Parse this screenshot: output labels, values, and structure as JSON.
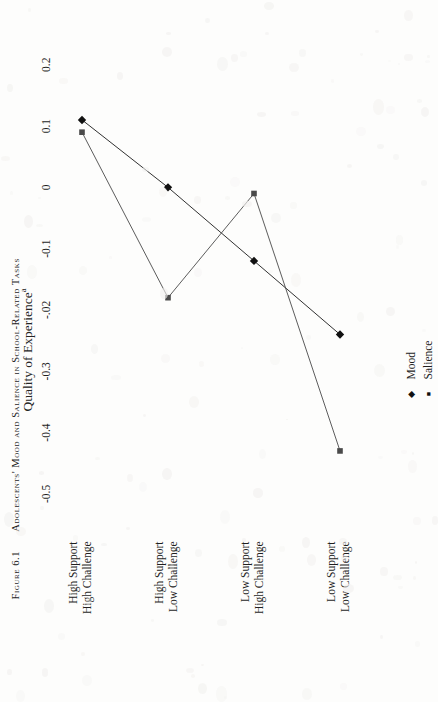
{
  "caption": {
    "figure_number": "Figure 6.1",
    "title": "Adolescents' Mood and Salience in School-Related Tasks"
  },
  "chart_data": {
    "type": "line",
    "title": "Adolescents' Mood and Salience in School-Related Tasks",
    "orientation": "rotated-90-ccw",
    "xlabel": "",
    "ylabel": "Quality of Experience",
    "ylabel_superscript": "a",
    "categories": [
      "High Support\nHigh Challenge",
      "High Support\nLow Challenge",
      "Low Support\nHigh Challenge",
      "Low Support\nLow Challenge"
    ],
    "category_lines": [
      [
        "High Support",
        "High Challenge"
      ],
      [
        "High Support",
        "Low Challenge"
      ],
      [
        "Low Support",
        "High Challenge"
      ],
      [
        "Low Support",
        "Low Challenge"
      ]
    ],
    "tick_labels": [
      "-0.5",
      "-0.4",
      "-0.3",
      "-.02",
      "-0.1",
      "0",
      "0.1",
      "0.2"
    ],
    "tick_values": [
      -0.5,
      -0.4,
      -0.3,
      -0.2,
      -0.1,
      0,
      0.1,
      0.2
    ],
    "ylim": [
      -0.55,
      0.22
    ],
    "grid": false,
    "legend_position": "bottom",
    "series": [
      {
        "name": "Mood",
        "marker": "diamond",
        "color": "#1a1a1a",
        "values": [
          0.11,
          0.0,
          -0.12,
          -0.24
        ]
      },
      {
        "name": "Salience",
        "marker": "square",
        "color": "#4a4a4a",
        "values": [
          0.09,
          -0.18,
          -0.01,
          -0.43
        ]
      }
    ]
  },
  "legend": {
    "items": [
      {
        "label": "Mood",
        "marker": "diamond"
      },
      {
        "label": "Salience",
        "marker": "square"
      }
    ]
  }
}
